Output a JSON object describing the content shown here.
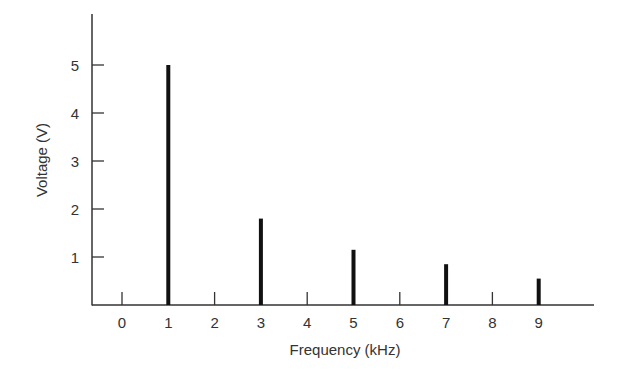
{
  "chart_data": {
    "type": "bar",
    "title": "",
    "xlabel": "Frequency (kHz)",
    "ylabel": "Voltage (V)",
    "x_ticks": [
      "0",
      "1",
      "2",
      "3",
      "4",
      "5",
      "6",
      "7",
      "8",
      "9"
    ],
    "y_ticks": [
      "1",
      "2",
      "3",
      "4",
      "5"
    ],
    "xlim": [
      -0.65,
      10.2
    ],
    "ylim": [
      0,
      6
    ],
    "grid": false,
    "legend": null,
    "categories": [
      "1",
      "3",
      "5",
      "7",
      "9"
    ],
    "x": [
      1,
      3,
      5,
      7,
      9
    ],
    "values": [
      5.0,
      1.8,
      1.15,
      0.85,
      0.55
    ],
    "minor_tick_marks_at": [
      0,
      2,
      4,
      6,
      8
    ],
    "style": "stem/line spectrum",
    "color": "#111111"
  }
}
